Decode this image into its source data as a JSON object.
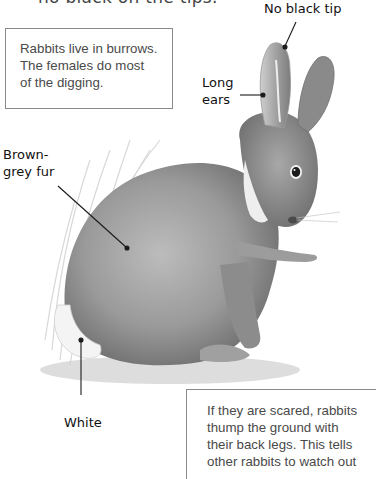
{
  "page": {
    "cut_off_heading": "no black on the tips."
  },
  "fact_boxes": [
    {
      "lines": [
        "Rabbits live in burrows.",
        "The females do most",
        "of the digging."
      ]
    },
    {
      "lines": [
        "If they are scared, rabbits",
        "thump the ground with",
        "their back legs. This tells",
        "other rabbits to watch out"
      ]
    }
  ],
  "labels": {
    "tip": "No black tip",
    "ears": [
      "Long",
      "ears"
    ],
    "fur": [
      "Brown-",
      "grey fur"
    ],
    "white": "White"
  },
  "illustration": {
    "subject": "rabbit-illustration",
    "style": "grey pencil drawing"
  }
}
